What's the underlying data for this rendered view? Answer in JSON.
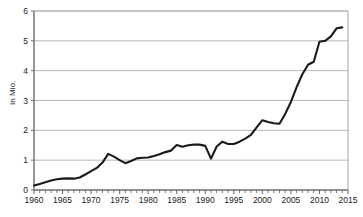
{
  "chart_data": {
    "type": "line",
    "title": "",
    "subtitle": "",
    "xlabel": "",
    "ylabel": "in Mio.",
    "xlim": [
      1960,
      2015
    ],
    "ylim": [
      0,
      6
    ],
    "grid": true,
    "grid_axis": "y",
    "legend": false,
    "legend_position": "none",
    "line_color": "#1a1a1a",
    "y_ticks": [
      0,
      1,
      2,
      3,
      4,
      5,
      6
    ],
    "y_tick_labels": [
      "0",
      "1",
      "2",
      "3",
      "4",
      "5",
      "6"
    ],
    "x_ticks": [
      1960,
      1965,
      1970,
      1975,
      1980,
      1985,
      1990,
      1995,
      2000,
      2005,
      2010,
      2015
    ],
    "x_tick_labels": [
      "1960",
      "1965",
      "1970",
      "1975",
      "1980",
      "1985",
      "1990",
      "1995",
      "2000",
      "2005",
      "2010",
      "2015"
    ],
    "x_minor_tick_interval": 1,
    "x": [
      1960,
      1961,
      1962,
      1963,
      1964,
      1965,
      1966,
      1967,
      1968,
      1969,
      1970,
      1971,
      1972,
      1973,
      1974,
      1975,
      1976,
      1977,
      1978,
      1979,
      1980,
      1981,
      1982,
      1983,
      1984,
      1985,
      1986,
      1987,
      1988,
      1989,
      1990,
      1991,
      1992,
      1993,
      1994,
      1995,
      1996,
      1997,
      1998,
      1999,
      2000,
      2001,
      2002,
      2003,
      2004,
      2005,
      2006,
      2007,
      2008,
      2009,
      2010,
      2011,
      2012,
      2013,
      2014
    ],
    "values": [
      0.15,
      0.2,
      0.26,
      0.32,
      0.36,
      0.38,
      0.39,
      0.38,
      0.42,
      0.52,
      0.63,
      0.74,
      0.92,
      1.21,
      1.12,
      1.0,
      0.9,
      0.97,
      1.06,
      1.08,
      1.09,
      1.14,
      1.2,
      1.27,
      1.32,
      1.51,
      1.45,
      1.5,
      1.52,
      1.52,
      1.48,
      1.05,
      1.46,
      1.62,
      1.54,
      1.54,
      1.62,
      1.72,
      1.85,
      2.1,
      2.34,
      2.28,
      2.24,
      2.22,
      2.55,
      2.95,
      3.45,
      3.88,
      4.2,
      4.3,
      4.97,
      5.0,
      5.15,
      5.42,
      5.45
    ],
    "series_name": "",
    "annotations": []
  },
  "layout": {
    "plot_left": 34,
    "plot_right": 348,
    "plot_top": 11,
    "plot_bottom": 190
  }
}
